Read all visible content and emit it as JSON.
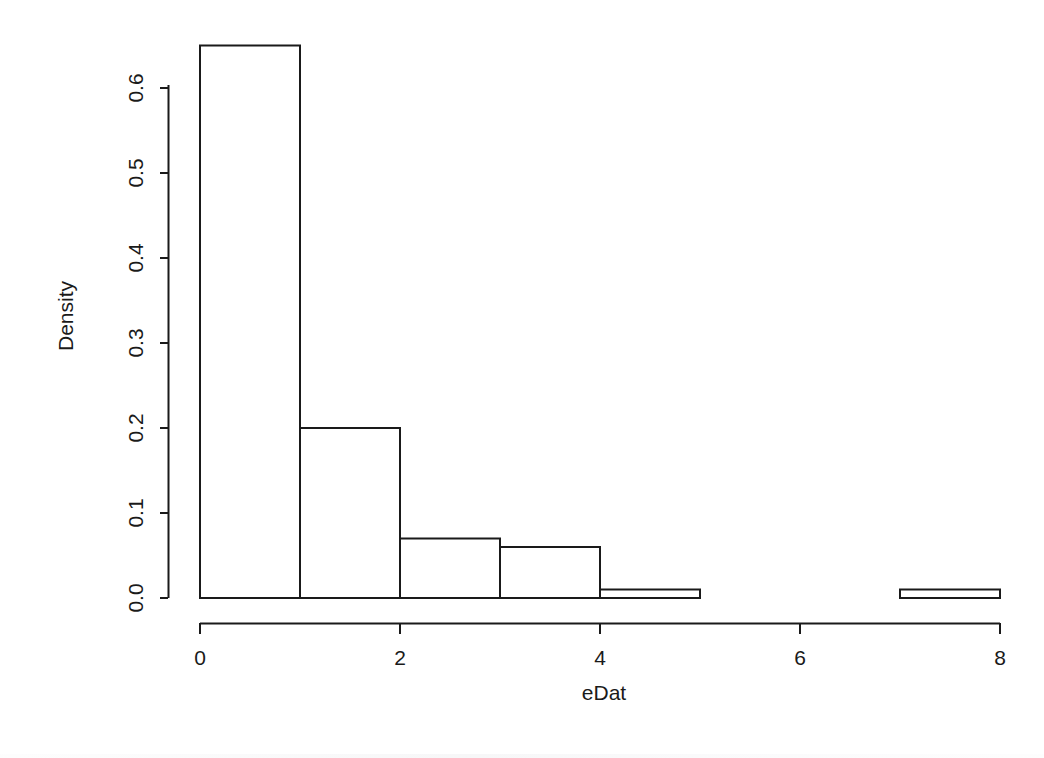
{
  "chart_data": {
    "type": "bar",
    "title": "",
    "subtitle": "",
    "xlabel": "eDat",
    "ylabel": "Density",
    "xlim": [
      0,
      8
    ],
    "ylim": [
      0.0,
      0.65
    ],
    "grid": false,
    "legend": null,
    "bin_width": 1,
    "bin_edges": [
      0,
      1,
      2,
      3,
      4,
      5,
      6,
      7,
      8
    ],
    "categories": [
      "0-1",
      "1-2",
      "2-3",
      "3-4",
      "4-5",
      "5-6",
      "6-7",
      "7-8"
    ],
    "values": [
      0.65,
      0.2,
      0.07,
      0.06,
      0.01,
      0.0,
      0.0,
      0.01
    ],
    "xticks": [
      0,
      2,
      4,
      6,
      8
    ],
    "xtick_labels": [
      "0",
      "2",
      "4",
      "6",
      "8"
    ],
    "yticks": [
      0.0,
      0.1,
      0.2,
      0.3,
      0.4,
      0.5,
      0.6
    ],
    "ytick_labels": [
      "0.0",
      "0.1",
      "0.2",
      "0.3",
      "0.4",
      "0.5",
      "0.6"
    ],
    "bar_fill": "#ffffff",
    "bar_stroke": "#1a1a1a",
    "axis_color": "#1a1a1a",
    "background": "#ffffff"
  },
  "axes": {
    "x_label": "eDat",
    "y_label": "Density",
    "x_tick_labels": [
      "0",
      "2",
      "4",
      "6",
      "8"
    ],
    "y_tick_labels": [
      "0.0",
      "0.1",
      "0.2",
      "0.3",
      "0.4",
      "0.5",
      "0.6"
    ]
  }
}
